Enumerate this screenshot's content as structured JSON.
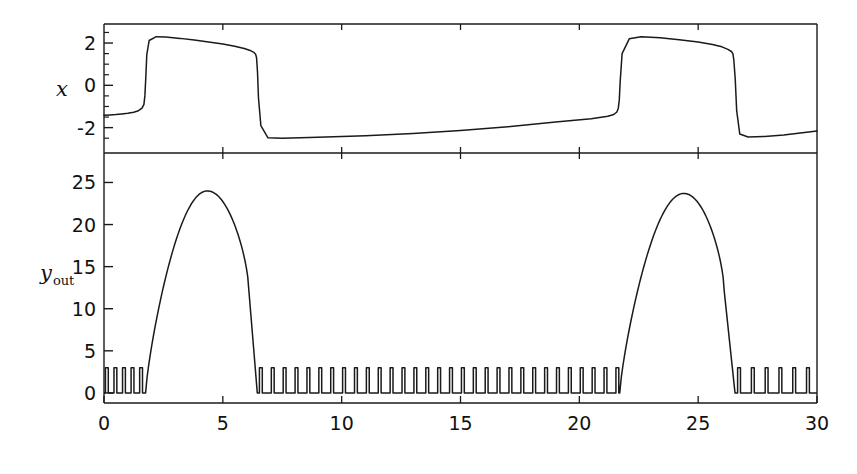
{
  "figure": {
    "background": "#ffffff",
    "line_color": "#1a1a1a",
    "width": 857,
    "height": 474
  },
  "panels": {
    "top": {
      "ylabel": "x",
      "ytick_labels": [
        "2",
        "0",
        "-2"
      ],
      "ytick_values": [
        2,
        0,
        -2
      ],
      "ylim": [
        -3.2,
        2.9
      ],
      "minor_ytick_values": [
        2.5,
        1.5,
        1,
        0.5,
        -0.5,
        -1,
        -1.5,
        -2.5
      ]
    },
    "bottom": {
      "ylabel_main": "y",
      "ylabel_sub": "out",
      "ytick_labels": [
        "25",
        "20",
        "15",
        "10",
        "5",
        "0"
      ],
      "ytick_values": [
        25,
        20,
        15,
        10,
        5,
        0
      ],
      "ylim": [
        -1.2,
        28.5
      ]
    },
    "shared_x": {
      "xtick_labels": [
        "0",
        "5",
        "10",
        "15",
        "20",
        "25",
        "30"
      ],
      "xtick_values": [
        0,
        5,
        10,
        15,
        20,
        25,
        30
      ],
      "xlim": [
        0,
        30
      ],
      "xlabel": ""
    }
  },
  "chart_data": {
    "type": "line",
    "title": "",
    "xlabel": "",
    "xlim": [
      0,
      30
    ],
    "grid": false,
    "legend": "none",
    "subplots": [
      {
        "name": "x-trace",
        "ylabel": "x",
        "ylim": [
          -3.2,
          2.9
        ],
        "ytick_values": [
          2,
          0,
          -2
        ],
        "description": "Slow relaxation oscillation: slow creep from -1.4 upward, fast jump up to +2.3 near t=1.75, slow decay to +1.45 by t=6.4, fast drop to -2.5, slow creep to -1.4 by t=21.6, fast jump to +2.3, slow decay to +1.5 by t=26.5, fast drop to -2.45, slow creep to -2.15 at t=30.",
        "x": [
          0.0,
          0.25,
          0.5,
          0.75,
          1.0,
          1.25,
          1.45,
          1.6,
          1.68,
          1.72,
          1.76,
          1.8,
          1.9,
          2.2,
          2.6,
          3.2,
          3.8,
          4.4,
          5.0,
          5.5,
          5.9,
          6.15,
          6.3,
          6.38,
          6.42,
          6.46,
          6.5,
          6.6,
          6.9,
          7.5,
          9.0,
          11.0,
          13.0,
          15.0,
          17.0,
          19.0,
          20.5,
          21.2,
          21.45,
          21.58,
          21.64,
          21.68,
          21.72,
          21.8,
          22.1,
          22.6,
          23.4,
          24.2,
          25.0,
          25.6,
          26.0,
          26.25,
          26.4,
          26.46,
          26.5,
          26.56,
          26.62,
          26.75,
          27.1,
          27.8,
          28.6,
          29.3,
          30.0
        ],
        "y": [
          -1.42,
          -1.4,
          -1.38,
          -1.35,
          -1.32,
          -1.27,
          -1.2,
          -1.08,
          -0.9,
          -0.5,
          0.4,
          1.45,
          2.12,
          2.3,
          2.28,
          2.22,
          2.14,
          2.05,
          1.95,
          1.85,
          1.74,
          1.65,
          1.56,
          1.47,
          1.3,
          0.6,
          -0.6,
          -1.9,
          -2.48,
          -2.5,
          -2.46,
          -2.38,
          -2.28,
          -2.14,
          -1.96,
          -1.74,
          -1.58,
          -1.46,
          -1.38,
          -1.26,
          -1.08,
          -0.7,
          0.2,
          1.5,
          2.2,
          2.3,
          2.25,
          2.16,
          2.05,
          1.93,
          1.82,
          1.7,
          1.6,
          1.5,
          1.2,
          0.3,
          -1.2,
          -2.3,
          -2.44,
          -2.42,
          -2.35,
          -2.26,
          -2.16
        ]
      },
      {
        "name": "y-out-trace",
        "ylabel": "y_out",
        "ylim": [
          -1.2,
          28.5
        ],
        "ytick_values": [
          0,
          5,
          10,
          15,
          20,
          25
        ],
        "description": "Bursting output: narrow sub-threshold spikes of height ~3 during quiescent phases, separated by large smooth burst envelopes peaking near 24.",
        "bursts": [
          {
            "start": 1.75,
            "peak_t": 4.35,
            "peak_y": 24.0,
            "shoulder_t": 6.1,
            "shoulder_y": 12.0,
            "end": 6.45
          },
          {
            "start": 21.7,
            "peak_t": 24.4,
            "peak_y": 23.7,
            "shoulder_t": 26.1,
            "shoulder_y": 12.0,
            "end": 26.55
          }
        ],
        "spike_height": 3.0,
        "spike_width": 0.12,
        "spike_trains": [
          {
            "from": 0.12,
            "to": 1.7,
            "interval": 0.36,
            "times": [
              0.12,
              0.48,
              0.84,
              1.2,
              1.56
            ]
          },
          {
            "from": 6.6,
            "to": 21.6,
            "interval": 0.5,
            "times": [
              6.6,
              7.1,
              7.6,
              8.1,
              8.6,
              9.1,
              9.6,
              10.1,
              10.6,
              11.1,
              11.6,
              12.1,
              12.6,
              13.1,
              13.6,
              14.1,
              14.6,
              15.1,
              15.6,
              16.1,
              16.6,
              17.1,
              17.6,
              18.1,
              18.6,
              19.1,
              19.6,
              20.1,
              20.6,
              21.1,
              21.6
            ]
          },
          {
            "from": 26.7,
            "to": 29.6,
            "interval": 0.58,
            "times": [
              26.72,
              27.3,
              27.88,
              28.46,
              29.04,
              29.62
            ]
          }
        ]
      }
    ]
  }
}
